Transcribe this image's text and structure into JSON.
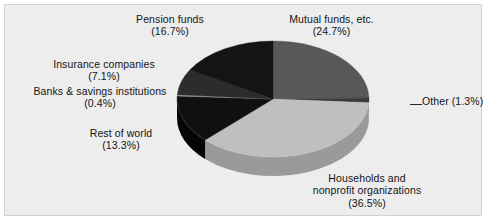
{
  "panel": {
    "background_color": "#ededed",
    "border_color": "#d2d2d2"
  },
  "chart_data": {
    "type": "pie",
    "title": "",
    "subtitle": "",
    "xlabel": "",
    "ylabel": "",
    "legend_position": "none",
    "grid": false,
    "three_d": true,
    "units": "percent",
    "total": 100.0,
    "start_angle_deg": 0,
    "direction": "clockwise",
    "categories": [
      "Mutual funds, etc.",
      "Other",
      "Households and nonprofit organizations",
      "Rest of world",
      "Banks & savings institutions",
      "Insurance companies",
      "Pension funds"
    ],
    "values": [
      24.7,
      1.3,
      36.5,
      13.3,
      0.4,
      7.1,
      16.7
    ],
    "slices": [
      {
        "id": "mutual-funds",
        "name": "Mutual funds, etc.",
        "value": 24.7,
        "value_text": "(24.7%)",
        "label_line1": "Mutual funds, etc.",
        "label_line2": "(24.7%)",
        "color": "#58585a",
        "side_color": "#3f3f41",
        "start_deg": 0.0,
        "end_deg": 88.92
      },
      {
        "id": "other",
        "name": "Other",
        "value": 1.3,
        "value_text": "(1.3%)",
        "label_line1": "Other (1.3%)",
        "label_line2": "",
        "color": "#3a3a3c",
        "side_color": "#2a2a2c",
        "start_deg": 88.92,
        "end_deg": 93.6
      },
      {
        "id": "households-nonprofit",
        "name": "Households and nonprofit organizations",
        "value": 36.5,
        "value_text": "(36.5%)",
        "label_line1": "Households and",
        "label_line2": "nonprofit organizations",
        "label_line3": "(36.5%)",
        "color": "#bfbfbf",
        "side_color": "#9a9a9a",
        "start_deg": 93.6,
        "end_deg": 225.0
      },
      {
        "id": "rest-of-world",
        "name": "Rest of world",
        "value": 13.3,
        "value_text": "(13.3%)",
        "label_line1": "Rest of world",
        "label_line2": "(13.3%)",
        "color": "#101010",
        "side_color": "#050505",
        "start_deg": 225.0,
        "end_deg": 272.88
      },
      {
        "id": "banks-savings",
        "name": "Banks & savings institutions",
        "value": 0.4,
        "value_text": "(0.4%)",
        "label_line1": "Banks & savings institutions",
        "label_line2": "(0.4%)",
        "color": "#8f8f8f",
        "side_color": "#6e6e6e",
        "start_deg": 272.88,
        "end_deg": 274.32
      },
      {
        "id": "insurance-companies",
        "name": "Insurance companies",
        "value": 7.1,
        "value_text": "(7.1%)",
        "label_line1": "Insurance companies",
        "label_line2": "(7.1%)",
        "color": "#2c2c2e",
        "side_color": "#1c1c1e",
        "start_deg": 274.32,
        "end_deg": 299.88
      },
      {
        "id": "pension-funds",
        "name": "Pension funds",
        "value": 16.7,
        "value_text": "(16.7%)",
        "label_line1": "Pension funds",
        "label_line2": "(16.7%)",
        "color": "#141414",
        "side_color": "#060606",
        "start_deg": 299.88,
        "end_deg": 360.0
      }
    ]
  },
  "labels": {
    "pension": "Pension funds\n(16.7%)",
    "mutual": "Mutual funds, etc.\n(24.7%)",
    "insurance": "Insurance companies\n(7.1%)",
    "banks": "Banks & savings institutions\n(0.4%)",
    "other": "Other (1.3%)",
    "rest_of_world": "Rest of world\n(13.3%)",
    "households": "Households and\nnonprofit organizations\n(36.5%)"
  }
}
